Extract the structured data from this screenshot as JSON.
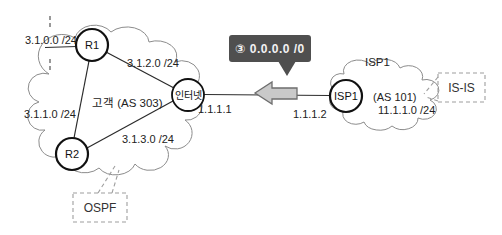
{
  "diagram": {
    "customer_cloud": {
      "label": "고객 (AS 303)"
    },
    "isp_cloud": {
      "name": "ISP1",
      "as_label": "(AS 101)",
      "network": "11.1.1.0 /24"
    },
    "nodes": {
      "r1": "R1",
      "r2": "R2",
      "internet": "인터넷",
      "isp1": "ISP1"
    },
    "networks": {
      "r1_stub": "3.1.0.0 /24",
      "r1_r2_link": "3.1.1.0 /24",
      "r1_internet_link": "3.1.2.0 /24",
      "r2_internet_link": "3.1.3.0 /24",
      "internet_ip": "1.1.1.1",
      "isp1_ip": "1.1.1.2"
    },
    "route_badge": {
      "text": "③ 0.0.0.0 /0"
    },
    "callouts": {
      "ospf": "OSPF",
      "isis": "IS-IS"
    },
    "colors": {
      "badge_bg": "#4f4f4f",
      "badge_text": "#f2f2f2",
      "arrow_fill": "#c9c9c9",
      "arrow_stroke": "#6e6e6e",
      "line": "#2b2b2b",
      "cloud_stroke": "#8c8c8c",
      "dashed_gray": "#9e9e9e"
    }
  }
}
